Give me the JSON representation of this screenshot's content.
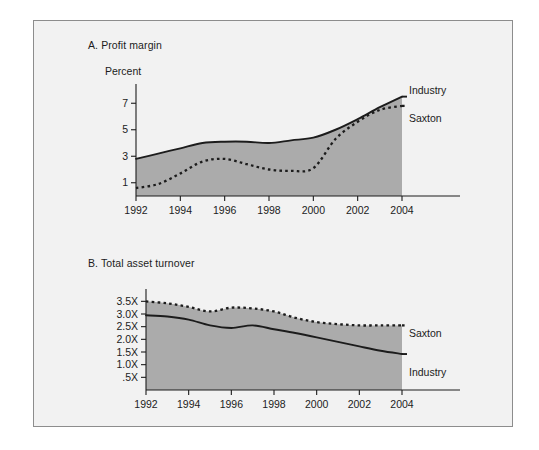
{
  "figure": {
    "background_color": "#f2f2f2",
    "border_color": "#8d8d8d",
    "fill_color": "#ababab",
    "line_color": "#1c1c1c"
  },
  "panel_a": {
    "title": "A. Profit margin",
    "axis_unit": "Percent",
    "label_industry": "Industry",
    "label_saxton": "Saxton"
  },
  "panel_b": {
    "title": "B. Total asset turnover",
    "label_saxton": "Saxton",
    "label_industry": "Industry"
  },
  "chart_data": [
    {
      "type": "area",
      "id": "profit-margin",
      "title": "A. Profit margin",
      "xlabel": "",
      "ylabel": "Percent",
      "xlim": [
        1992,
        2004
      ],
      "ylim": [
        0,
        8
      ],
      "xticks": [
        1992,
        1994,
        1996,
        1998,
        2000,
        2002,
        2004
      ],
      "xticklabels": [
        "1992",
        "1994",
        "1996",
        "1998",
        "2000",
        "2002",
        "2004"
      ],
      "yticks": [
        1,
        3,
        5,
        7
      ],
      "yticklabels": [
        "1",
        "3",
        "5",
        "7"
      ],
      "grid": false,
      "legend_position": "right-of-plot",
      "x": [
        1992,
        1993,
        1994,
        1995,
        1996,
        1997,
        1998,
        1999,
        2000,
        2001,
        2002,
        2003,
        2004
      ],
      "series": [
        {
          "name": "Industry",
          "style": "solid",
          "filled": true,
          "values": [
            2.8,
            3.2,
            3.6,
            4.0,
            4.1,
            4.1,
            4.0,
            4.2,
            4.4,
            5.0,
            5.8,
            6.7,
            7.5
          ]
        },
        {
          "name": "Saxton",
          "style": "dotted",
          "filled": false,
          "values": [
            0.6,
            0.9,
            1.7,
            2.6,
            2.8,
            2.4,
            2.0,
            1.9,
            2.1,
            4.3,
            5.6,
            6.5,
            6.8
          ]
        }
      ]
    },
    {
      "type": "area",
      "id": "total-asset-turnover",
      "title": "B. Total asset turnover",
      "xlabel": "",
      "ylabel": "",
      "xlim": [
        1992,
        2004
      ],
      "ylim": [
        0,
        3.75
      ],
      "xticks": [
        1992,
        1994,
        1996,
        1998,
        2000,
        2002,
        2004
      ],
      "xticklabels": [
        "1992",
        "1994",
        "1996",
        "1998",
        "2000",
        "2002",
        "2004"
      ],
      "yticks": [
        0.5,
        1.0,
        1.5,
        2.0,
        2.5,
        3.0,
        3.5
      ],
      "yticklabels": [
        ".5X",
        "1.0X",
        "1.5X",
        "2.0X",
        "2.5X",
        "3.0X",
        "3.5X"
      ],
      "grid": false,
      "legend_position": "right-of-plot",
      "x": [
        1992,
        1993,
        1994,
        1995,
        1996,
        1997,
        1998,
        1999,
        2000,
        2001,
        2002,
        2003,
        2004
      ],
      "series": [
        {
          "name": "Saxton",
          "style": "dotted",
          "filled": true,
          "values": [
            3.5,
            3.42,
            3.28,
            3.1,
            3.25,
            3.22,
            3.1,
            2.85,
            2.68,
            2.6,
            2.55,
            2.55,
            2.55
          ]
        },
        {
          "name": "Industry",
          "style": "solid",
          "filled": false,
          "values": [
            2.95,
            2.9,
            2.78,
            2.55,
            2.45,
            2.55,
            2.4,
            2.25,
            2.08,
            1.9,
            1.72,
            1.55,
            1.42
          ]
        }
      ]
    }
  ]
}
